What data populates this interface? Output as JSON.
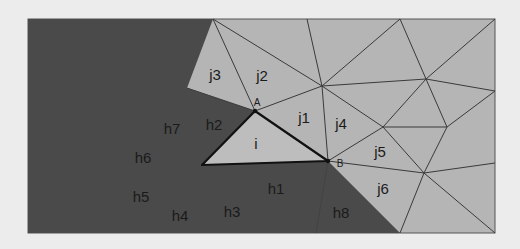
{
  "diagram": {
    "colors": {
      "page_background": "#ececec",
      "dark_region": "#4a4a4a",
      "light_region": "#b5b5b5",
      "triangle_fill": "#bdbdbd",
      "mesh_edge": "#3a3a3a",
      "triangle_edge": "#111111"
    },
    "frame": {
      "x": 28,
      "y": 19,
      "width": 467,
      "height": 214
    },
    "vertices": {
      "A": {
        "label": "A",
        "x": 255,
        "y": 111
      },
      "B": {
        "label": "B",
        "x": 328,
        "y": 161
      }
    },
    "triangle_i": {
      "label": "i",
      "points": [
        [
          255,
          111
        ],
        [
          202,
          165
        ],
        [
          328,
          161
        ]
      ]
    },
    "light_region_labels": [
      {
        "id": "j1",
        "label": "j1",
        "x": 304,
        "y": 117
      },
      {
        "id": "j2",
        "label": "j2",
        "x": 262,
        "y": 75
      },
      {
        "id": "j3",
        "label": "j3",
        "x": 215,
        "y": 74
      },
      {
        "id": "j4",
        "label": "j4",
        "x": 341,
        "y": 123
      },
      {
        "id": "j5",
        "label": "j5",
        "x": 380,
        "y": 151
      },
      {
        "id": "j6",
        "label": "j6",
        "x": 383,
        "y": 188
      }
    ],
    "dark_region_labels": [
      {
        "id": "h1",
        "label": "h1",
        "x": 276,
        "y": 188
      },
      {
        "id": "h2",
        "label": "h2",
        "x": 214,
        "y": 124
      },
      {
        "id": "h3",
        "label": "h3",
        "x": 232,
        "y": 211
      },
      {
        "id": "h4",
        "label": "h4",
        "x": 180,
        "y": 215
      },
      {
        "id": "h5",
        "label": "h5",
        "x": 141,
        "y": 196
      },
      {
        "id": "h6",
        "label": "h6",
        "x": 143,
        "y": 157
      },
      {
        "id": "h7",
        "label": "h7",
        "x": 172,
        "y": 128
      },
      {
        "id": "h8",
        "label": "h8",
        "x": 341,
        "y": 212
      }
    ],
    "triangle_label": {
      "label": "i",
      "x": 256,
      "y": 143
    }
  }
}
